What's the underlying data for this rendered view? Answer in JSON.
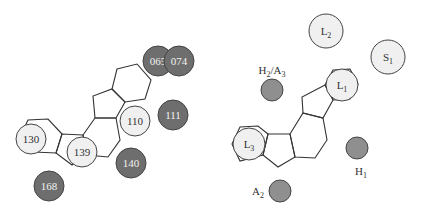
{
  "colors": {
    "dark_residue": "#6e6e6e",
    "light_residue": "#f0f0f0",
    "pharm_feature": "#8f8f8f",
    "pharm_light": "#f0f0f0",
    "bond": "#333333",
    "dark_text": "#f2f2f2",
    "light_text": "#333333"
  },
  "left_panel": {
    "residues": [
      {
        "id": "065",
        "label": "065",
        "cx": 158,
        "cy": 61,
        "r": 15,
        "shade": "dark"
      },
      {
        "id": "074",
        "label": "074",
        "cx": 179,
        "cy": 61,
        "r": 15,
        "shade": "dark"
      },
      {
        "id": "111",
        "label": "111",
        "cx": 173,
        "cy": 115,
        "r": 15,
        "shade": "dark"
      },
      {
        "id": "110",
        "label": "110",
        "cx": 135,
        "cy": 121,
        "r": 15,
        "shade": "light"
      },
      {
        "id": "130",
        "label": "130",
        "cx": 31,
        "cy": 139,
        "r": 15,
        "shade": "light"
      },
      {
        "id": "139",
        "label": "139",
        "cx": 82,
        "cy": 152,
        "r": 15,
        "shade": "light"
      },
      {
        "id": "140",
        "label": "140",
        "cx": 131,
        "cy": 163,
        "r": 15,
        "shade": "dark"
      },
      {
        "id": "168",
        "label": "168",
        "cx": 49,
        "cy": 186,
        "r": 15,
        "shade": "dark"
      }
    ]
  },
  "right_panel": {
    "features": [
      {
        "id": "L2",
        "main": "L",
        "sub": "2",
        "cx": 326,
        "cy": 31,
        "r": 17,
        "shade": "light",
        "label_inside": true
      },
      {
        "id": "S1",
        "main": "S",
        "sub": "1",
        "cx": 388,
        "cy": 57,
        "r": 17,
        "shade": "light",
        "label_inside": true
      },
      {
        "id": "L1",
        "main": "L",
        "sub": "1",
        "cx": 342,
        "cy": 85,
        "r": 16,
        "shade": "light",
        "label_inside": true
      },
      {
        "id": "L3",
        "main": "L",
        "sub": "3",
        "cx": 249,
        "cy": 144,
        "r": 16,
        "shade": "light",
        "label_inside": true
      },
      {
        "id": "H2A3",
        "main": "H",
        "sub": "2",
        "main2": "/A",
        "sub2": "3",
        "cx": 272,
        "cy": 90,
        "r": 11,
        "shade": "feature",
        "label_x": 272,
        "label_y": 74
      },
      {
        "id": "H1",
        "main": "H",
        "sub": "1",
        "cx": 357,
        "cy": 148,
        "r": 11,
        "shade": "feature",
        "label_x": 361,
        "label_y": 175
      },
      {
        "id": "A2",
        "main": "A",
        "sub": "2",
        "cx": 280,
        "cy": 191,
        "r": 11,
        "shade": "feature",
        "label_x": 258,
        "label_y": 195
      }
    ]
  }
}
